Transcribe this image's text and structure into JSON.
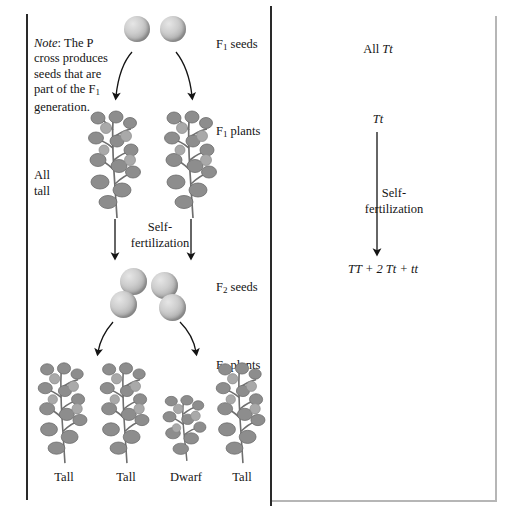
{
  "figure": {
    "ink_color": "#141414",
    "rule_color": "#2a2a2a",
    "light_rule_color": "#b6b6b6",
    "seed_color": "#b4b4b4",
    "plant_color": "#8a8a8a"
  },
  "left_panel": {
    "note": {
      "lead": "Note",
      "colon": ":",
      "text": "  The P cross produces seeds that are part of the F",
      "sub": "1",
      "tail": " generation."
    },
    "all_tall": "All\ntall",
    "stage_labels": [
      {
        "prefix": "F",
        "sub": "1",
        "suffix": " seeds"
      },
      {
        "prefix": "F",
        "sub": "1",
        "suffix": " plants"
      },
      {
        "prefix": "F",
        "sub": "2",
        "suffix": " seeds"
      },
      {
        "prefix": "F",
        "sub": "2",
        "suffix": " plants"
      }
    ],
    "self_fertilization": "Self-\nfertilization",
    "f1_seeds_count": 2,
    "f2_seeds_count": 4,
    "f1_plants_count": 2,
    "f2_plants": [
      {
        "label": "Tall",
        "height": "tall"
      },
      {
        "label": "Tall",
        "height": "tall"
      },
      {
        "label": "Dwarf",
        "height": "dwarf"
      },
      {
        "label": "Tall",
        "height": "tall"
      }
    ]
  },
  "right_panel": {
    "all_genotype": {
      "prefix": "All ",
      "genotype": "Tt"
    },
    "f1_genotype": "Tt",
    "self_fertilization": "Self-\nfertilization",
    "f2_ratio": "TT + 2 Tt + tt"
  }
}
